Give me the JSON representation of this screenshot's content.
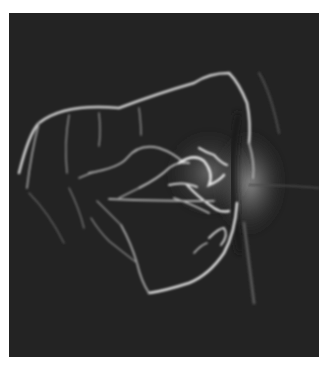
{
  "image": {
    "kind": "fluorescein angiogram of retina",
    "alt": "Grayscale retinal angiography image showing bright fluorescent vessels forming a loop around a central lesion near the optic disc on the right",
    "colors": {
      "background": "#222222",
      "vessel": "#d8d8d8",
      "glow": "#8a8a8a",
      "page": "#ffffff"
    }
  }
}
